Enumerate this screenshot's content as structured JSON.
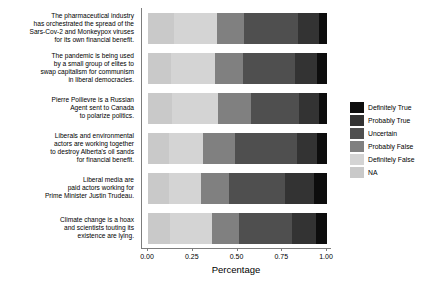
{
  "chart_data": {
    "type": "bar",
    "orientation": "horizontal",
    "stacked": true,
    "normalized": true,
    "title": "",
    "xlabel": "Percentage",
    "ylabel": "",
    "xlim": [
      0.0,
      1.0
    ],
    "xticks": [
      "0.00",
      "0.25",
      "0.50",
      "0.75",
      "1.00"
    ],
    "xtick_values": [
      0.0,
      0.25,
      0.5,
      0.75,
      1.0
    ],
    "grid": false,
    "legend_position": "right",
    "legend_title": "",
    "series": [
      {
        "name": "Definitely True",
        "color": "#0d0d0d",
        "values": [
          0.045,
          0.055,
          0.045,
          0.055,
          0.075,
          0.06
        ]
      },
      {
        "name": "Probably True",
        "color": "#333333",
        "values": [
          0.115,
          0.125,
          0.11,
          0.115,
          0.16,
          0.135
        ]
      },
      {
        "name": "Uncertain",
        "color": "#4f4f4f",
        "values": [
          0.305,
          0.29,
          0.27,
          0.345,
          0.31,
          0.295
        ]
      },
      {
        "name": "Probably False",
        "color": "#808080",
        "values": [
          0.15,
          0.155,
          0.185,
          0.18,
          0.16,
          0.15
        ]
      },
      {
        "name": "Definitely False",
        "color": "#d4d4d4",
        "values": [
          0.24,
          0.245,
          0.255,
          0.185,
          0.18,
          0.235
        ]
      },
      {
        "name": "NA",
        "color": "#c9c9c9",
        "values": [
          0.145,
          0.13,
          0.135,
          0.12,
          0.115,
          0.125
        ]
      }
    ],
    "categories": [
      "The pharmaceutical industry\nhas orchestrated the spread of the\nSars-Cov-2 and Monkeypox viruses\nfor its own financial benefit.",
      "The pandemic is being used\nby a small group of elites to\nswap capitalism for communism\nin liberal democracies.",
      "Pierre Poilievre is a Russian\nAgent sent to Canada\nto polarize politics.",
      "Liberals and environmental\nactors are working together\nto destroy Alberta's oil sands\nfor financial benefit.",
      "Liberal media are\npaid actors working for\nPrime Minister Justin Trudeau.",
      "Climate change is a hoax\nand scientists touting its\nexistence are lying."
    ],
    "bar_order_left_to_right": [
      "NA",
      "Definitely False",
      "Probably False",
      "Uncertain",
      "Probably True",
      "Definitely True"
    ]
  },
  "colors": {
    "axis": "#7d7d7d",
    "text": "#000000",
    "background": "#ffffff"
  }
}
